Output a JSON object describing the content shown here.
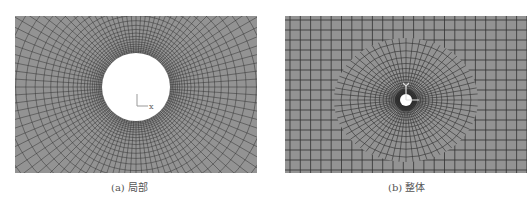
{
  "figure": {
    "panels": [
      {
        "id": "a",
        "caption": "(a) 局部",
        "description": "local mesh around circular hole",
        "axis_label": "x"
      },
      {
        "id": "b",
        "caption": "(b) 整体",
        "description": "global mesh",
        "axis_label": "x"
      }
    ],
    "colors": {
      "mesh_background": "#939393",
      "mesh_lines": "#333333",
      "hole": "#ffffff"
    }
  }
}
